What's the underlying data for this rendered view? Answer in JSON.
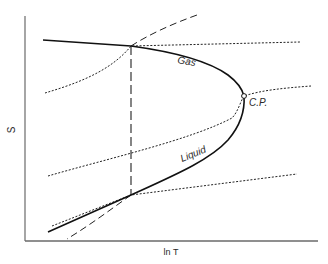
{
  "diagram": {
    "type": "phase-diagram",
    "axes": {
      "x_label": "ln T",
      "y_label": "S"
    },
    "curves": {
      "gas_label": "Gas",
      "liquid_label": "Liquid",
      "critical_point_label": "C.P."
    },
    "line_styles": {
      "coexistence": "solid",
      "tie_line": "long-dashed",
      "metastable": "dashed",
      "isobars": "dotted"
    },
    "colors": {
      "ink": "#1a1a1a",
      "axis": "#6a6a6a",
      "background": "#ffffff"
    }
  }
}
